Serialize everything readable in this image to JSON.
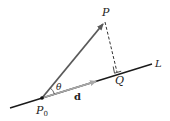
{
  "diagram": {
    "type": "vector-projection-distance-to-line",
    "labels": {
      "point_p": "P",
      "point_p0": "P",
      "point_p0_sub": "0",
      "point_q": "Q",
      "line_l": "L",
      "vector_d": "d",
      "angle": "θ"
    },
    "colors": {
      "line": "#1a1a1a",
      "vector_pp0": "#5a5a5a",
      "vector_d": "#a8a8a8",
      "dashed": "#333333",
      "text": "#222222"
    },
    "points": {
      "P0": [
        42,
        98
      ],
      "P": [
        105,
        22
      ],
      "Q": [
        117,
        72
      ],
      "d_end": [
        97,
        81
      ],
      "line_start": [
        10,
        108
      ],
      "line_end": [
        152,
        64
      ]
    }
  }
}
